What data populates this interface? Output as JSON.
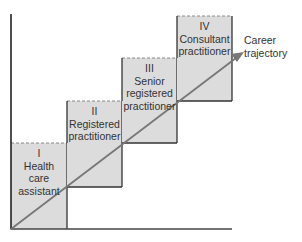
{
  "diagram": {
    "type": "career-ladder",
    "colors": {
      "box_fill": "#dcdcdc",
      "box_stroke": "#333333",
      "axis": "#222222",
      "arrow": "#777777",
      "text": "#333333"
    },
    "steps": [
      {
        "numeral": "I",
        "line1": "Health",
        "line2": "care",
        "line3": "assistant"
      },
      {
        "numeral": "II",
        "line1": "Registered",
        "line2": "practitioner",
        "line3": ""
      },
      {
        "numeral": "III",
        "line1": "Senior",
        "line2": "registered",
        "line3": "practitioner"
      },
      {
        "numeral": "IV",
        "line1": "Consultant",
        "line2": "practitioner",
        "line3": ""
      }
    ],
    "arrow_label": {
      "line1": "Career",
      "line2": "trajectory"
    }
  }
}
